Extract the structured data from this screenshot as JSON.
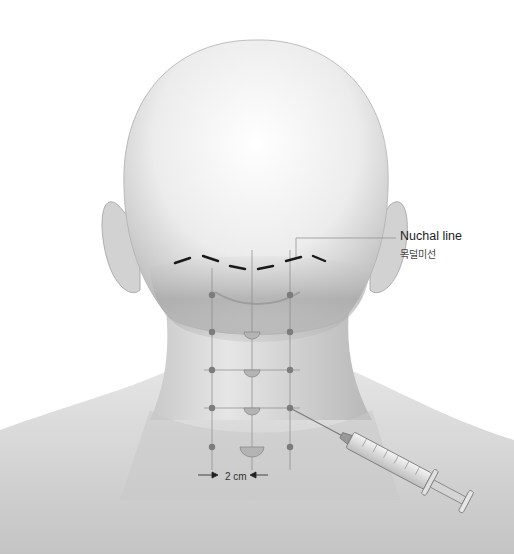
{
  "figure": {
    "labels": {
      "nuchal_line_en": "Nuchal line",
      "nuchal_line_ko": "목덜미선",
      "spacing": "2 cm"
    },
    "grid": {
      "columns_x": [
        212,
        252,
        290
      ],
      "rows_y": [
        295,
        332,
        370,
        408,
        447
      ],
      "point_color": "#7c7c7c"
    },
    "colors": {
      "skin_light": "#f2f2f2",
      "skin_mid": "#cfcfcf",
      "skin_dark": "#a9a9a9",
      "dash": "#1a1a1a",
      "guide": "#8a8a8a"
    },
    "icons": {
      "syringe": "syringe-icon",
      "arrow_left": "arrow-right-icon",
      "arrow_right": "arrow-left-icon"
    }
  }
}
